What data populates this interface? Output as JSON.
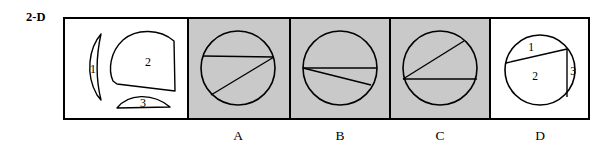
{
  "question": {
    "number_label": "2-D",
    "type": "shape-assembly-multiple-choice"
  },
  "colors": {
    "stroke": "#000000",
    "panel_gray": "#c9c9c9",
    "panel_white": "#ffffff",
    "text": "#000000"
  },
  "frame": {
    "x": 63,
    "y": 17,
    "width": 527,
    "height": 102,
    "border_width": 2,
    "dividers_x": [
      188,
      290,
      390,
      490
    ]
  },
  "pieces_panel": {
    "name": "given-pieces",
    "background": "#ffffff",
    "pieces": [
      {
        "label": "1",
        "shape": "lens-crescent",
        "label_x": 93,
        "label_y": 69
      },
      {
        "label": "2",
        "shape": "rounded-quadrant",
        "label_x": 148,
        "label_y": 62
      },
      {
        "label": "3",
        "shape": "thin-circular-segment",
        "label_x": 143,
        "label_y": 103
      }
    ]
  },
  "options": [
    {
      "letter": "A",
      "background": "#c9c9c9",
      "circle": {
        "cx": 238,
        "cy": 68,
        "r": 37
      },
      "chords": [
        {
          "name": "horizontal-upper-chord",
          "x1": 203,
          "y1": 56,
          "x2": 274,
          "y2": 57
        },
        {
          "name": "diagonal-chord",
          "x1": 274,
          "y1": 57,
          "x2": 211,
          "y2": 95
        }
      ]
    },
    {
      "letter": "B",
      "background": "#c9c9c9",
      "circle": {
        "cx": 340,
        "cy": 68,
        "r": 37
      },
      "chords": [
        {
          "name": "horizontal-diameter",
          "x1": 303,
          "y1": 68,
          "x2": 377,
          "y2": 68
        },
        {
          "name": "shallow-diagonal-chord",
          "x1": 303,
          "y1": 68,
          "x2": 371,
          "y2": 85
        }
      ]
    },
    {
      "letter": "C",
      "background": "#c9c9c9",
      "circle": {
        "cx": 440,
        "cy": 68,
        "r": 37
      },
      "chords": [
        {
          "name": "horizontal-diameter",
          "x1": 403,
          "y1": 79,
          "x2": 477,
          "y2": 79
        },
        {
          "name": "rising-diagonal-chord",
          "x1": 403,
          "y1": 79,
          "x2": 464,
          "y2": 41
        }
      ]
    },
    {
      "letter": "D",
      "background": "#ffffff",
      "circle": {
        "cx": 540,
        "cy": 70,
        "r": 35
      },
      "chords": [
        {
          "name": "upper-chord",
          "x1": 506,
          "y1": 63,
          "x2": 567,
          "y2": 49
        },
        {
          "name": "vertical-right-chord",
          "x1": 567,
          "y1": 49,
          "x2": 567,
          "y2": 97
        }
      ],
      "region_labels": [
        {
          "label": "1",
          "x": 531,
          "y": 47
        },
        {
          "label": "2",
          "x": 535,
          "y": 76
        },
        {
          "label": "3",
          "x": 573,
          "y": 71
        }
      ]
    }
  ]
}
